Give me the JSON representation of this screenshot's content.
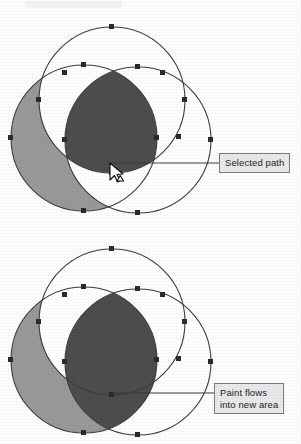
{
  "figure_top": {
    "name": "three-overlapping-circles-selected-path",
    "fills": {
      "gray": "#999999",
      "dark": "#4d4d4d",
      "white": "#ffffff",
      "stroke": "#3c3c3c",
      "node": "#2b2b2b"
    },
    "circles": [
      {
        "id": "circle-top",
        "cx": 112,
        "cy": 100,
        "r": 73
      },
      {
        "id": "circle-left",
        "cx": 84,
        "cy": 138,
        "r": 73
      },
      {
        "id": "circle-right",
        "cx": 138,
        "cy": 140,
        "r": 73
      }
    ],
    "shaded_gray_label": "unselected filled region",
    "shaded_dark_label": "selected path fill region",
    "cursor": {
      "x": 112,
      "y": 166,
      "type": "arrow-pointer-with-paint-marker"
    }
  },
  "figure_bottom": {
    "name": "three-overlapping-circles-paint-flowed",
    "fills": {
      "gray": "#999999",
      "dark": "#4d4d4d",
      "white": "#ffffff",
      "stroke": "#3c3c3c",
      "node": "#2b2b2b"
    },
    "circles": [
      {
        "id": "circle-top",
        "cx": 112,
        "cy": 322,
        "r": 73
      },
      {
        "id": "circle-left",
        "cx": 84,
        "cy": 360,
        "r": 73
      },
      {
        "id": "circle-right",
        "cx": 138,
        "cy": 362,
        "r": 73
      }
    ],
    "shaded_gray_label": "unselected filled region",
    "shaded_dark_label": "new enlarged painted area"
  },
  "callouts": {
    "selected_path": "Selected path",
    "paint_flows_line1": "Paint flows",
    "paint_flows_line2": "into new area"
  }
}
